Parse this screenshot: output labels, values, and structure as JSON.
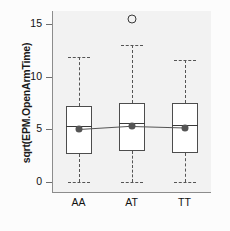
{
  "chart_data": {
    "type": "box",
    "title": "",
    "xlabel": "",
    "ylabel": "sqrt(EPM.OpenArmTime)",
    "categories": [
      "AA",
      "AT",
      "TT"
    ],
    "ylim": [
      -0.8,
      16.0
    ],
    "yticks": [
      0,
      5,
      10,
      15
    ],
    "ytick_labels": [
      "0",
      "5",
      "10",
      "15"
    ],
    "grid": false,
    "legend": null,
    "series": [
      {
        "name": "AA",
        "whisker_low": 0.0,
        "q1": 2.7,
        "median": 5.35,
        "q3": 7.2,
        "whisker_high": 11.9,
        "mean": 5.0,
        "outliers": []
      },
      {
        "name": "AT",
        "whisker_low": 0.0,
        "q1": 2.9,
        "median": 5.6,
        "q3": 7.5,
        "whisker_high": 13.0,
        "mean": 5.3,
        "outliers": [
          15.5
        ]
      },
      {
        "name": "TT",
        "whisker_low": 0.0,
        "q1": 2.8,
        "median": 5.4,
        "q3": 7.5,
        "whisker_high": 11.6,
        "mean": 5.15,
        "outliers": []
      }
    ],
    "mean_connector": true,
    "colors": {
      "panel_background": "#f2f2f2",
      "box_fill": "#ffffff",
      "box_border": "#4d4d4d",
      "whisker": "#555555",
      "mean_marker": "#555555",
      "outlier_border": "#3a3a3a",
      "axis": "#8c8c8c",
      "text": "#111111"
    }
  },
  "axis": {
    "y_title": "sqrt(EPM.OpenArmTime)",
    "y_tick_labels": [
      "15",
      "10",
      "5",
      "0"
    ],
    "x_tick_labels": [
      "AA",
      "AT",
      "TT"
    ]
  }
}
